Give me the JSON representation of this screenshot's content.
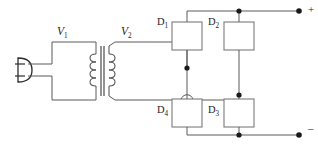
{
  "diagram": {
    "type": "circuit-schematic",
    "colors": {
      "background": "#ffffff",
      "wire": "#5a5a5a",
      "wire_dark": "#3c3c3c",
      "component_outline": "#7a7a7a",
      "node": "#1a1a1a",
      "text": "#1d1d1d"
    }
  },
  "labels": {
    "primary_voltage": "V",
    "primary_voltage_sub": "1",
    "secondary_voltage": "V",
    "secondary_voltage_sub": "2",
    "diode1": "D",
    "diode1_sub": "1",
    "diode2": "D",
    "diode2_sub": "2",
    "diode3": "D",
    "diode3_sub": "3",
    "diode4": "D",
    "diode4_sub": "4",
    "output_positive": "+",
    "output_negative": "–"
  },
  "components": {
    "ac_plug": {
      "name": "ac-input-plug",
      "leads": 2
    },
    "transformer": {
      "name": "transformer",
      "core_lines": 2,
      "primary_turns": 4,
      "secondary_turns": 4
    },
    "diodes": [
      {
        "id": "D1",
        "label": "D",
        "subscript": "1",
        "x": 172,
        "y": 22,
        "w": 30,
        "h": 28
      },
      {
        "id": "D2",
        "label": "D",
        "subscript": "2",
        "x": 224,
        "y": 22,
        "w": 30,
        "h": 28
      },
      {
        "id": "D3",
        "label": "D",
        "subscript": "3",
        "x": 224,
        "y": 99,
        "w": 30,
        "h": 28
      },
      {
        "id": "D4",
        "label": "D",
        "subscript": "4",
        "x": 172,
        "y": 99,
        "w": 30,
        "h": 28
      }
    ],
    "nodes": [
      {
        "name": "node-top-rail",
        "x": 236,
        "y": 11
      },
      {
        "name": "node-d1-secondary",
        "x": 187,
        "y": 68
      },
      {
        "name": "node-d2-d3-mid",
        "x": 236,
        "y": 95
      },
      {
        "name": "node-bottom-rail",
        "x": 236,
        "y": 135
      },
      {
        "name": "terminal-positive",
        "x": 299,
        "y": 11
      },
      {
        "name": "terminal-negative",
        "x": 299,
        "y": 135
      }
    ],
    "wire_crossing": {
      "name": "wire-hop-crossover",
      "x": 187,
      "y": 95
    }
  }
}
